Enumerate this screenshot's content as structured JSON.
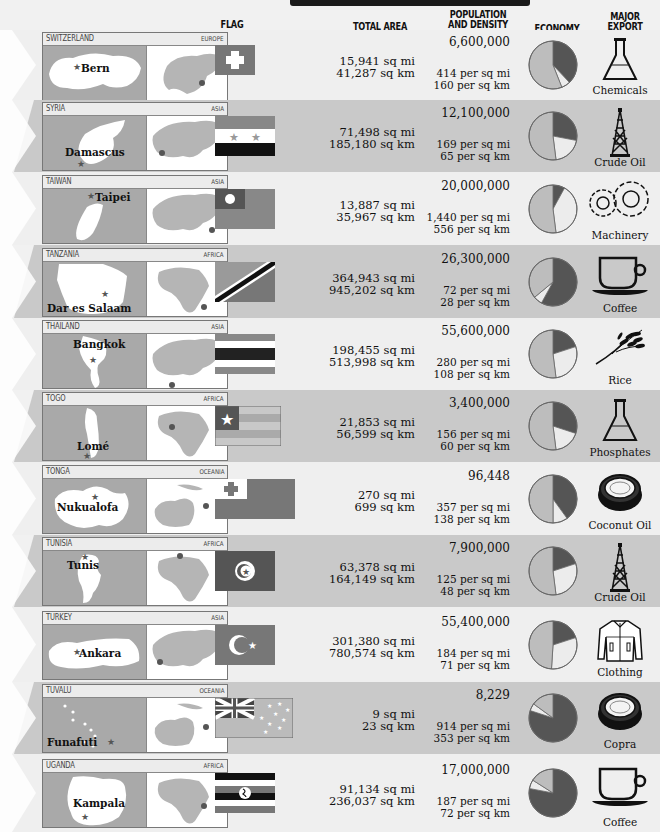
{
  "headers": {
    "flag": "FLAG",
    "total_area": "TOTAL AREA",
    "population_line1": "POPULATION",
    "population_line2": "AND DENSITY",
    "economy": "ECONOMY",
    "export_line1": "MAJOR",
    "export_line2": "EXPORT"
  },
  "colors": {
    "band_dark": "#c9c9c9",
    "band_light": "#efefef",
    "map_land": "#a9a9a9",
    "pie_dark": "#555555",
    "pie_mid": "#bdbdbd",
    "pie_light": "#ececec"
  },
  "countries": [
    {
      "name": "Switzerland",
      "region": "Europe",
      "capital": "Bern",
      "area_mi": "15,941 sq mi",
      "area_km": "41,287 sq km",
      "population": "6,600,000",
      "density_mi": "414 per sq mi",
      "density_km": "160 per sq km",
      "economy": [
        38,
        6,
        56
      ],
      "export": "Chemicals",
      "export_icon": "flask-icon"
    },
    {
      "name": "Syria",
      "region": "Asia",
      "capital": "Damascus",
      "area_mi": "71,498 sq mi",
      "area_km": "185,180 sq km",
      "population": "12,100,000",
      "density_mi": "169 per sq mi",
      "density_km": "65 per sq km",
      "economy": [
        28,
        20,
        52
      ],
      "export": "Crude Oil",
      "export_icon": "oil-derrick-icon"
    },
    {
      "name": "Taiwan",
      "region": "Asia",
      "capital": "Taipei",
      "area_mi": "13,887 sq mi",
      "area_km": "35,967 sq km",
      "population": "20,000,000",
      "density_mi": "1,440 per sq mi",
      "density_km": "556 per sq km",
      "economy": [
        8,
        40,
        52
      ],
      "export": "Machinery",
      "export_icon": "gears-icon"
    },
    {
      "name": "Tanzania",
      "region": "Africa",
      "capital": "Dar es Salaam",
      "area_mi": "364,943 sq mi",
      "area_km": "945,202 sq km",
      "population": "26,300,000",
      "density_mi": "72 per sq mi",
      "density_km": "28 per sq km",
      "economy": [
        58,
        6,
        36
      ],
      "export": "Coffee",
      "export_icon": "coffee-cup-icon"
    },
    {
      "name": "Thailand",
      "region": "Asia",
      "capital": "Bangkok",
      "area_mi": "198,455 sq mi",
      "area_km": "513,998 sq km",
      "population": "55,600,000",
      "density_mi": "280 per sq mi",
      "density_km": "108 per sq km",
      "economy": [
        20,
        28,
        52
      ],
      "export": "Rice",
      "export_icon": "rice-stalk-icon"
    },
    {
      "name": "Togo",
      "region": "Africa",
      "capital": "Lomé",
      "area_mi": "21,853 sq mi",
      "area_km": "56,599 sq km",
      "population": "3,400,000",
      "density_mi": "156 per sq mi",
      "density_km": "60 per sq km",
      "economy": [
        30,
        18,
        52
      ],
      "export": "Phosphates",
      "export_icon": "flask-icon"
    },
    {
      "name": "Tonga",
      "region": "Oceania",
      "capital": "Nukualofa",
      "area_mi": "270 sq mi",
      "area_km": "699 sq km",
      "population": "96,448",
      "density_mi": "357 per sq mi",
      "density_km": "138 per sq km",
      "economy": [
        40,
        10,
        50
      ],
      "export": "Coconut Oil",
      "export_icon": "coconut-icon"
    },
    {
      "name": "Tunisia",
      "region": "Africa",
      "capital": "Tunis",
      "area_mi": "63,378 sq mi",
      "area_km": "164,149 sq km",
      "population": "7,900,000",
      "density_mi": "125 per sq mi",
      "density_km": "48 per sq km",
      "economy": [
        20,
        28,
        52
      ],
      "export": "Crude Oil",
      "export_icon": "oil-derrick-icon"
    },
    {
      "name": "Turkey",
      "region": "Asia",
      "capital": "Ankara",
      "area_mi": "301,380 sq mi",
      "area_km": "780,574 sq km",
      "population": "55,400,000",
      "density_mi": "184 per sq mi",
      "density_km": "71 per sq km",
      "economy": [
        20,
        31,
        49
      ],
      "export": "Clothing",
      "export_icon": "jacket-icon"
    },
    {
      "name": "Tuvalu",
      "region": "Oceania",
      "capital": "Funafuti",
      "area_mi": "9 sq mi",
      "area_km": "23 sq km",
      "population": "8,229",
      "density_mi": "914 per sq mi",
      "density_km": "353 per sq km",
      "economy": [
        80,
        5,
        15
      ],
      "export": "Copra",
      "export_icon": "coconut-icon"
    },
    {
      "name": "Uganda",
      "region": "Africa",
      "capital": "Kampala",
      "area_mi": "91,134 sq mi",
      "area_km": "236,037 sq km",
      "population": "17,000,000",
      "density_mi": "187 per sq mi",
      "density_km": "72 per sq km",
      "economy": [
        78,
        6,
        16
      ],
      "export": "Coffee",
      "export_icon": "coffee-cup-icon"
    }
  ]
}
